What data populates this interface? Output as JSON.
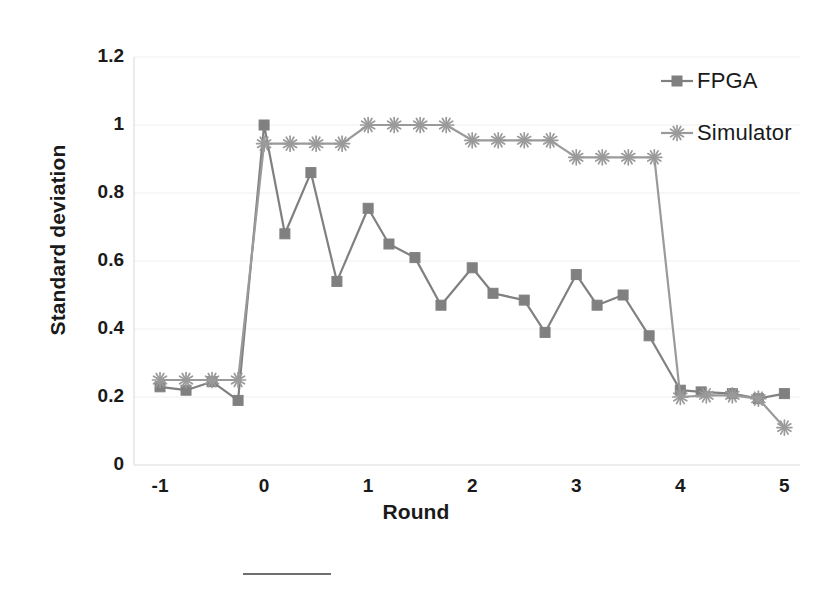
{
  "chart_data": {
    "type": "line",
    "title": "",
    "xlabel": "Round",
    "ylabel": "Standard deviation",
    "xlim": [
      -1.25,
      5.15
    ],
    "ylim": [
      0,
      1.2
    ],
    "xticks": [
      "-1",
      "0",
      "1",
      "2",
      "3",
      "4",
      "5"
    ],
    "xtick_values": [
      -1,
      0,
      1,
      2,
      3,
      4,
      5
    ],
    "yticks": [
      "0",
      "0.2",
      "0.4",
      "0.6",
      "0.8",
      "1",
      "1.2"
    ],
    "ytick_values": [
      0,
      0.2,
      0.4,
      0.6,
      0.8,
      1,
      1.2
    ],
    "grid": true,
    "legend_position": "top-right",
    "series": [
      {
        "name": "FPGA",
        "marker": "square",
        "color": "#808080",
        "x": [
          -1.0,
          -0.75,
          -0.5,
          -0.25,
          0.0,
          0.2,
          0.45,
          0.7,
          1.0,
          1.2,
          1.45,
          1.7,
          2.0,
          2.2,
          2.5,
          2.7,
          3.0,
          3.2,
          3.45,
          3.7,
          4.0,
          4.2,
          4.5,
          4.75,
          5.0
        ],
        "values": [
          0.23,
          0.22,
          0.245,
          0.19,
          1.0,
          0.68,
          0.86,
          0.54,
          0.755,
          0.65,
          0.61,
          0.47,
          0.58,
          0.505,
          0.485,
          0.39,
          0.56,
          0.47,
          0.5,
          0.38,
          0.22,
          0.215,
          0.21,
          0.195,
          0.21
        ]
      },
      {
        "name": "Simulator",
        "marker": "asterisk",
        "color": "#9a9a9a",
        "x": [
          -1.0,
          -0.75,
          -0.5,
          -0.25,
          0.0,
          0.25,
          0.5,
          0.75,
          1.0,
          1.25,
          1.5,
          1.75,
          2.0,
          2.25,
          2.5,
          2.75,
          3.0,
          3.25,
          3.5,
          3.75,
          4.0,
          4.25,
          4.5,
          4.75,
          5.0
        ],
        "values": [
          0.25,
          0.25,
          0.25,
          0.25,
          0.945,
          0.945,
          0.945,
          0.945,
          1.0,
          1.0,
          1.0,
          1.0,
          0.955,
          0.955,
          0.955,
          0.955,
          0.905,
          0.905,
          0.905,
          0.905,
          0.2,
          0.205,
          0.205,
          0.195,
          0.11
        ]
      }
    ]
  },
  "legend": {
    "items": [
      {
        "label": "FPGA"
      },
      {
        "label": "Simulator"
      }
    ]
  },
  "axes": {
    "y_title": "Standard deviation",
    "x_title": "Round"
  }
}
